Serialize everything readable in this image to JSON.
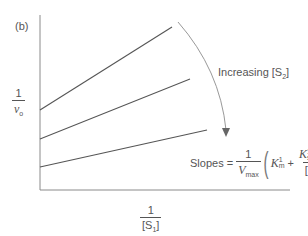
{
  "panel_label": "(b)",
  "y_axis": {
    "numerator": "1",
    "denominator_var": "v",
    "denominator_sub": "o"
  },
  "x_axis": {
    "numerator": "1",
    "denominator_open": "[S",
    "denominator_sub": "1",
    "denominator_close": "]"
  },
  "annotation": {
    "text": "Increasing [S",
    "sub": "2",
    "close": "]"
  },
  "formula": {
    "lhs": "Slopes =",
    "frac1_num": "1",
    "frac1_den_var": "V",
    "frac1_den_sub": "max",
    "term1_var": "K",
    "term1_sub": "m",
    "term1_sup": "1",
    "plus": "+",
    "frac2_num_var1": "K",
    "frac2_num_var1_sub": "s",
    "frac2_num_var1_sup": "1",
    "frac2_num_var2": "K",
    "frac2_num_var2_sub": "m",
    "frac2_num_var2_sup": "2",
    "frac2_den_open": "[S",
    "frac2_den_sub": "2",
    "frac2_den_close": "]"
  },
  "colors": {
    "axis": "#8a8a8a",
    "lines": "#555555",
    "arrow": "#999999"
  },
  "lines": [
    {
      "name": "low-S2",
      "x1": 40,
      "y1": 110,
      "x2": 172,
      "y2": 27
    },
    {
      "name": "mid-S2",
      "x1": 40,
      "y1": 139,
      "x2": 190,
      "y2": 79
    },
    {
      "name": "high-S2",
      "x1": 40,
      "y1": 167,
      "x2": 207,
      "y2": 130
    }
  ]
}
